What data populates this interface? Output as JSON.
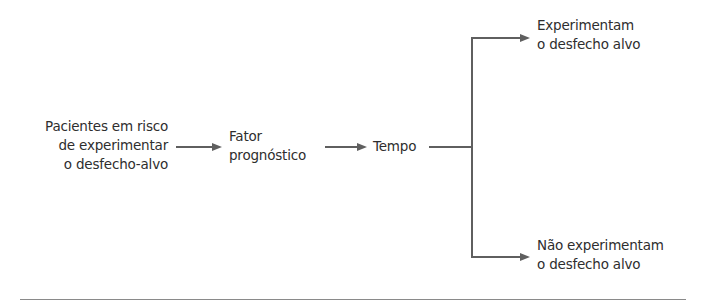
{
  "diagram": {
    "type": "flowchart",
    "nodes": {
      "start": {
        "lines": [
          "Pacientes em risco",
          "de experimentar",
          "o desfecho-alvo"
        ]
      },
      "factor": {
        "lines": [
          "Fator",
          "prognóstico"
        ]
      },
      "time": {
        "label": "Tempo"
      },
      "outcome_yes": {
        "lines": [
          "Experimentam",
          "o desfecho alvo"
        ]
      },
      "outcome_no": {
        "lines": [
          "Não experimentam",
          "o desfecho alvo"
        ]
      }
    },
    "edges": [
      {
        "from": "start",
        "to": "factor"
      },
      {
        "from": "factor",
        "to": "time"
      },
      {
        "from": "time",
        "to": "outcome_yes"
      },
      {
        "from": "time",
        "to": "outcome_no"
      }
    ],
    "colors": {
      "text": "#2e2e2e",
      "arrow": "#5f5f5f",
      "rule": "#8a8a8a"
    }
  }
}
